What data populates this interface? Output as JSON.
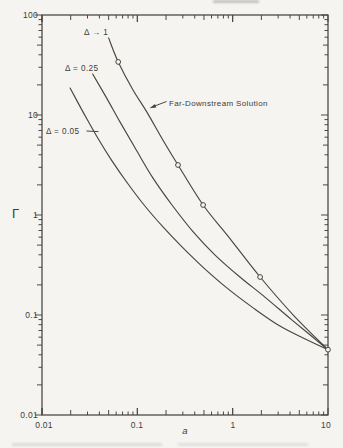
{
  "figure": {
    "background": "#f5f4f1",
    "ink": "#3e3c39",
    "y_axis": {
      "title": "Γ",
      "tick_labels": [
        "100",
        "10",
        "1",
        "0.1",
        "0.01"
      ]
    },
    "x_axis": {
      "title": "a",
      "tick_labels": [
        "0.01",
        "0.1",
        "1",
        "10"
      ]
    },
    "annotations": {
      "delta_1": "Δ → 1",
      "delta_025": "Δ = 0.25",
      "delta_005": "Δ = 0.05",
      "far_downstream": "Far-Downstream Solution"
    }
  },
  "chart_data": {
    "type": "line",
    "title": "",
    "xlabel": "a",
    "ylabel": "Γ",
    "x_scale": "log",
    "y_scale": "log",
    "xlim": [
      0.01,
      10
    ],
    "ylim": [
      0.01,
      100
    ],
    "x_ticks": [
      0.01,
      0.1,
      1,
      10
    ],
    "y_ticks": [
      0.01,
      0.1,
      1,
      10,
      100
    ],
    "grid": false,
    "legend_position": "inline-labels",
    "series": [
      {
        "name": "Δ → 1",
        "type": "line",
        "points": [
          [
            0.05,
            59
          ],
          [
            0.063,
            34
          ],
          [
            0.09,
            17.8
          ],
          [
            0.126,
            10.7
          ],
          [
            0.186,
            5.6
          ],
          [
            0.267,
            3.16
          ],
          [
            0.49,
            1.26
          ],
          [
            0.89,
            0.62
          ],
          [
            1.94,
            0.24
          ],
          [
            4.5,
            0.096
          ],
          [
            10,
            0.045
          ]
        ]
      },
      {
        "name": "Δ = 0.25",
        "type": "line",
        "points": [
          [
            0.034,
            25.7
          ],
          [
            0.047,
            15.1
          ],
          [
            0.066,
            8.5
          ],
          [
            0.097,
            4.5
          ],
          [
            0.146,
            2.34
          ],
          [
            0.231,
            1.26
          ],
          [
            0.384,
            0.68
          ],
          [
            0.65,
            0.4
          ],
          [
            1.19,
            0.24
          ],
          [
            2.18,
            0.151
          ],
          [
            4.2,
            0.089
          ],
          [
            10,
            0.045
          ]
        ]
      },
      {
        "name": "Δ = 0.05",
        "type": "line",
        "points": [
          [
            0.0197,
            18.6
          ],
          [
            0.027,
            10.7
          ],
          [
            0.038,
            6.0
          ],
          [
            0.054,
            3.5
          ],
          [
            0.08,
            2.04
          ],
          [
            0.12,
            1.23
          ],
          [
            0.186,
            0.76
          ],
          [
            0.294,
            0.48
          ],
          [
            0.49,
            0.3
          ],
          [
            0.85,
            0.19
          ],
          [
            1.6,
            0.12
          ],
          [
            3.1,
            0.078
          ],
          [
            5.7,
            0.058
          ],
          [
            10,
            0.045
          ]
        ]
      },
      {
        "name": "Far-Downstream Solution",
        "type": "scatter",
        "marker": "open-circle",
        "points": [
          [
            0.063,
            34
          ],
          [
            0.267,
            3.16
          ],
          [
            0.49,
            1.26
          ],
          [
            1.94,
            0.24
          ],
          [
            10,
            0.045
          ]
        ]
      }
    ]
  }
}
